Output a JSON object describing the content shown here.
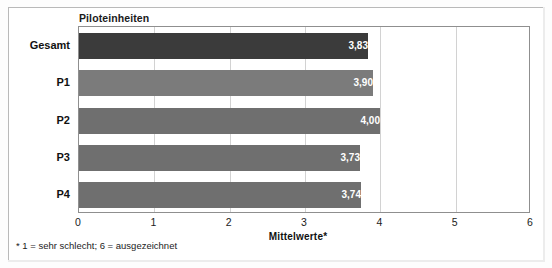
{
  "chart_data": {
    "type": "bar",
    "orientation": "horizontal",
    "title": "Piloteinheiten",
    "categories": [
      "Gesamt",
      "P1",
      "P2",
      "P3",
      "P4"
    ],
    "values": [
      3.83,
      3.9,
      4.0,
      3.73,
      3.74
    ],
    "value_labels": [
      "3,83",
      "3,90",
      "4,00",
      "3,73",
      "3,74"
    ],
    "bar_colors": [
      "#3b3b3b",
      "#7b7b7b",
      "#6f6f6f",
      "#6f6f6f",
      "#6f6f6f"
    ],
    "xlabel": "Mittelwerte*",
    "ylabel": "",
    "xlim": [
      0,
      6
    ],
    "xticks": [
      0,
      1,
      2,
      3,
      4,
      5,
      6
    ],
    "xtick_labels": [
      "0",
      "1",
      "2",
      "3",
      "4",
      "5",
      "6"
    ],
    "grid": true,
    "grid_axis": "x",
    "legend": false,
    "footnote": "* 1 = sehr schlecht; 6 = ausgezeichnet"
  },
  "footnote": "* 1 = sehr schlecht; 6 = ausgezeichnet"
}
